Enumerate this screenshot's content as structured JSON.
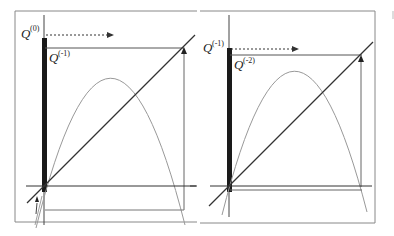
{
  "figure": {
    "type": "cobweb-iteration-diagram",
    "colors": {
      "frame": "#777777",
      "axis": "#333333",
      "curve": "#999999",
      "diagonal": "#333333",
      "bar": "#1a1a1a",
      "arrow": "#333333"
    },
    "panels": [
      {
        "id": "left",
        "top_label": {
          "base": "Q",
          "sup": "(0)"
        },
        "inner_label": {
          "base": "Q",
          "sup": "(-1)"
        },
        "arrow_style": "dashed-right-arrow",
        "return_arrow": "up-arrow-on-right-vertical",
        "bottom_arrow": "small-up-arrow-near-origin"
      },
      {
        "id": "right",
        "top_label": {
          "base": "Q",
          "sup": "(-1)"
        },
        "inner_label": {
          "base": "Q",
          "sup": "(-2)"
        },
        "arrow_style": "dashed-right-arrow",
        "return_arrow": "up-arrow-on-right-vertical"
      }
    ]
  }
}
